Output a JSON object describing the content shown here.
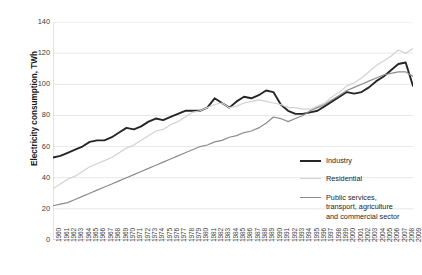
{
  "chart": {
    "type": "line",
    "ylabel": "Electricity consumption, TWh",
    "xlabel": "",
    "title": ""
  },
  "axis": {
    "y_ticks": [
      "0",
      "20",
      "40",
      "60",
      "80",
      "100",
      "120",
      "140"
    ],
    "x_ticks": [
      "1960",
      "1961",
      "1962",
      "1963",
      "1964",
      "1965",
      "1966",
      "1967",
      "1968",
      "1969",
      "1970",
      "1971",
      "1972",
      "1973",
      "1974",
      "1975",
      "1976",
      "1977",
      "1978",
      "1979",
      "1980",
      "1981",
      "1982",
      "1983",
      "1984",
      "1985",
      "1986",
      "1987",
      "1988",
      "1989",
      "1990",
      "1991",
      "1992",
      "1993",
      "1994",
      "1995",
      "1996",
      "1997",
      "1998",
      "1999",
      "2000",
      "2001",
      "2002",
      "2003",
      "2004",
      "2005",
      "2006",
      "2007",
      "2008",
      "2009"
    ]
  },
  "legend": {
    "position": "right",
    "items": [
      {
        "label": "Industry",
        "color": "#262626"
      },
      {
        "label": "Residential",
        "color": "#d2d2d2"
      },
      {
        "label": "Public services,\ntransport, agriculture\nand commercial sector",
        "color": "#8c8c8c"
      }
    ]
  },
  "chart_data": {
    "type": "line",
    "title": "",
    "xlabel": "",
    "ylabel": "Electricity consumption, TWh",
    "ylim": [
      0,
      140
    ],
    "xlim": [
      1960,
      2009
    ],
    "grid": true,
    "legend_position": "right",
    "x": [
      1960,
      1961,
      1962,
      1963,
      1964,
      1965,
      1966,
      1967,
      1968,
      1969,
      1970,
      1971,
      1972,
      1973,
      1974,
      1975,
      1976,
      1977,
      1978,
      1979,
      1980,
      1981,
      1982,
      1983,
      1984,
      1985,
      1986,
      1987,
      1988,
      1989,
      1990,
      1991,
      1992,
      1993,
      1994,
      1995,
      1996,
      1997,
      1998,
      1999,
      2000,
      2001,
      2002,
      2003,
      2004,
      2005,
      2006,
      2007,
      2008,
      2009
    ],
    "categories": [
      "1960",
      "1961",
      "1962",
      "1963",
      "1964",
      "1965",
      "1966",
      "1967",
      "1968",
      "1969",
      "1970",
      "1971",
      "1972",
      "1973",
      "1974",
      "1975",
      "1976",
      "1977",
      "1978",
      "1979",
      "1980",
      "1981",
      "1982",
      "1983",
      "1984",
      "1985",
      "1986",
      "1987",
      "1988",
      "1989",
      "1990",
      "1991",
      "1992",
      "1993",
      "1994",
      "1995",
      "1996",
      "1997",
      "1998",
      "1999",
      "2000",
      "2001",
      "2002",
      "2003",
      "2004",
      "2005",
      "2006",
      "2007",
      "2008",
      "2009"
    ],
    "series": [
      {
        "name": "Industry",
        "color": "#262626",
        "values": [
          53,
          54,
          56,
          58,
          60,
          63,
          64,
          64,
          66,
          69,
          72,
          71,
          73,
          76,
          78,
          77,
          79,
          81,
          83,
          83,
          83,
          85,
          91,
          88,
          85,
          89,
          92,
          91,
          93,
          96,
          95,
          87,
          83,
          81,
          81,
          82,
          83,
          86,
          89,
          92,
          95,
          94,
          95,
          98,
          102,
          105,
          109,
          113,
          114,
          99
        ]
      },
      {
        "name": "Residential",
        "color": "#d2d2d2",
        "values": [
          33,
          36,
          39,
          41,
          44,
          47,
          49,
          51,
          53,
          56,
          59,
          61,
          64,
          67,
          70,
          71,
          74,
          76,
          79,
          82,
          83,
          85,
          87,
          88,
          85,
          86,
          88,
          89,
          90,
          89,
          88,
          87,
          85,
          85,
          84,
          84,
          86,
          88,
          92,
          95,
          99,
          101,
          104,
          108,
          112,
          115,
          118,
          122,
          120,
          123
        ]
      },
      {
        "name": "Public services, transport, agriculture and commercial sector",
        "color": "#8c8c8c",
        "values": [
          22,
          23,
          24,
          26,
          28,
          30,
          32,
          34,
          36,
          38,
          40,
          42,
          44,
          46,
          48,
          50,
          52,
          54,
          56,
          58,
          60,
          61,
          63,
          64,
          66,
          67,
          69,
          70,
          72,
          75,
          79,
          78,
          76,
          78,
          80,
          83,
          85,
          87,
          90,
          93,
          96,
          98,
          100,
          102,
          104,
          106,
          107,
          108,
          108,
          105
        ]
      }
    ]
  }
}
